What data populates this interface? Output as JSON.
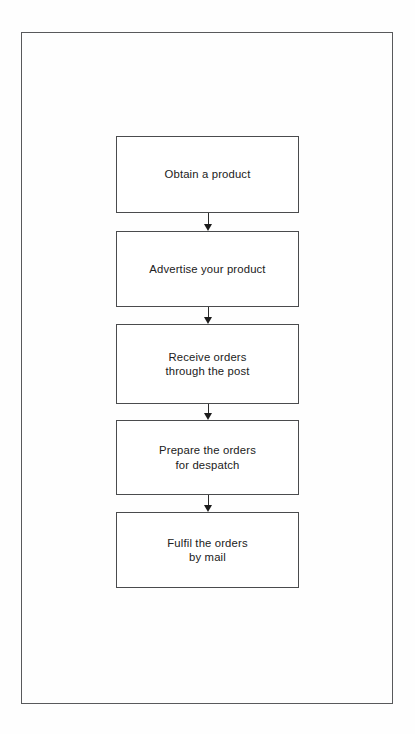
{
  "page": {
    "background_color": "#fefefe",
    "frame_color": "#58595b"
  },
  "chart_data": {
    "type": "diagram",
    "diagram_type": "flowchart",
    "orientation": "vertical",
    "title": "",
    "node_shape": "rectangle",
    "connector": "arrow-down",
    "box_border_color": "#4a4b4d",
    "box_fill_color": "#ffffff",
    "text_color": "#212121",
    "nodes": [
      {
        "id": "step-1",
        "label": "Obtain a product",
        "lines": [
          "Obtain a product"
        ]
      },
      {
        "id": "step-2",
        "label": "Advertise your product",
        "lines": [
          "Advertise your product"
        ]
      },
      {
        "id": "step-3",
        "label": "Receive orders\nthrough the post",
        "lines": [
          "Receive orders",
          "through the post"
        ]
      },
      {
        "id": "step-4",
        "label": "Prepare the orders\nfor despatch",
        "lines": [
          "Prepare the orders",
          "for despatch"
        ]
      },
      {
        "id": "step-5",
        "label": "Fulfil the orders\nby mail",
        "lines": [
          "Fulfil the orders",
          "by mail"
        ]
      }
    ],
    "edges": [
      {
        "from": "step-1",
        "to": "step-2",
        "label": ""
      },
      {
        "from": "step-2",
        "to": "step-3",
        "label": ""
      },
      {
        "from": "step-3",
        "to": "step-4",
        "label": ""
      },
      {
        "from": "step-4",
        "to": "step-5",
        "label": ""
      }
    ]
  }
}
